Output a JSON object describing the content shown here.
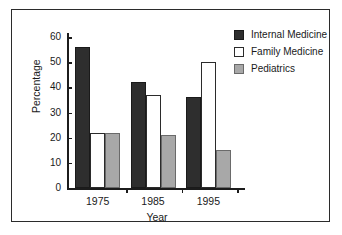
{
  "chart_data": {
    "type": "bar",
    "title": "",
    "subtitle": "",
    "xlabel": "Year",
    "ylabel": "Percentage",
    "categories": [
      "1975",
      "1985",
      "1995"
    ],
    "series": [
      {
        "name": "Internal Medicine",
        "color": "#2e2e2e",
        "values": [
          56,
          42,
          36
        ]
      },
      {
        "name": "Family Medicine",
        "color": "#ffffff",
        "values": [
          22,
          37,
          50
        ]
      },
      {
        "name": "Pediatrics",
        "color": "#a8a8a8",
        "values": [
          22,
          21,
          15
        ]
      }
    ],
    "ylim": [
      0,
      60
    ],
    "ytick_labels": [
      "0",
      "10",
      "20",
      "30",
      "40",
      "50",
      "60"
    ],
    "ytick_values": [
      0,
      10,
      20,
      30,
      40,
      50,
      60
    ],
    "grid": false,
    "legend_position": "top-right",
    "annotations": []
  },
  "legend": {
    "entries": [
      {
        "label": "Internal Medicine",
        "swatch": "dark"
      },
      {
        "label": "Family Medicine",
        "swatch": "white"
      },
      {
        "label": "Pediatrics",
        "swatch": "gray"
      }
    ]
  },
  "axes": {
    "x_title": "Year",
    "y_title": "Percentage"
  }
}
